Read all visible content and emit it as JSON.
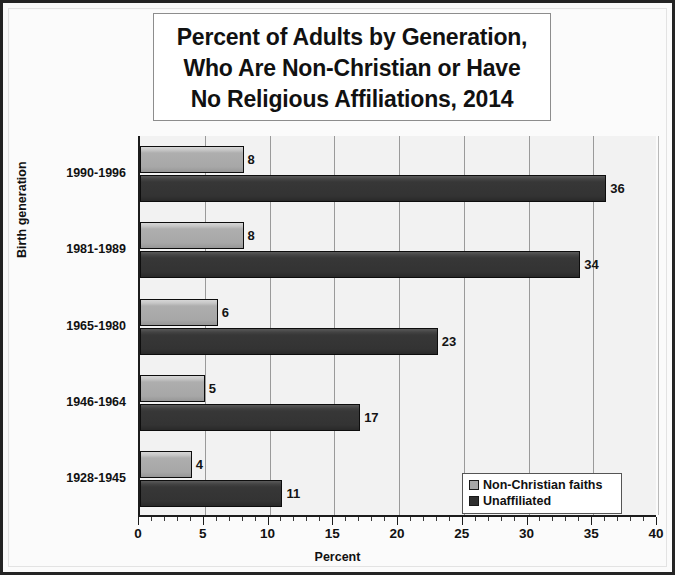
{
  "chart_data": {
    "type": "bar",
    "orientation": "horizontal",
    "title": "Percent of Adults by Generation, Who Are Non-Christian or Have No Religious Affiliations, 2014",
    "title_lines": [
      "Percent of Adults by Generation,",
      "Who Are Non-Christian or Have",
      "No Religious Affiliations, 2014"
    ],
    "xlabel": "Percent",
    "ylabel": "Birth generation",
    "categories": [
      "1990-1996",
      "1981-1989",
      "1965-1980",
      "1946-1964",
      "1928-1945"
    ],
    "series": [
      {
        "name": "Non-Christian faiths",
        "values": [
          8,
          8,
          6,
          5,
          4
        ],
        "color": "#a7a7a7"
      },
      {
        "name": "Unaffiliated",
        "values": [
          36,
          34,
          23,
          17,
          11
        ],
        "color": "#333333"
      }
    ],
    "xlim": [
      0,
      40
    ],
    "x_major_ticks": [
      0,
      5,
      10,
      15,
      20,
      25,
      30,
      35,
      40
    ],
    "x_tick_labels": [
      "0",
      "5",
      "10",
      "15",
      "20",
      "25",
      "30",
      "35",
      "40"
    ],
    "x_minor_tick_step": 1,
    "grid": "vertical-major",
    "legend_position": "bottom-right",
    "plot_background": "#f2f2f2",
    "axis_color": "#1c1c1c",
    "gridline_color": "#9a9a9a"
  }
}
